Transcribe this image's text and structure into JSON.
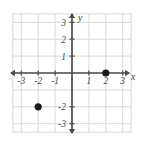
{
  "chart_data": {
    "type": "scatter",
    "title": "",
    "xlabel": "x",
    "ylabel": "y",
    "xlim": [
      -3.6,
      3.6
    ],
    "ylim": [
      -3.6,
      3.6
    ],
    "grid": true,
    "grid_step": 1,
    "legend": "none",
    "x_ticks": [
      -3,
      -2,
      -1,
      1,
      2,
      3
    ],
    "y_ticks": [
      -3,
      -2,
      1,
      2,
      3
    ],
    "x_tick_labels": [
      "-3",
      "-2",
      "-1",
      "1",
      "2",
      "3"
    ],
    "y_tick_labels": [
      "-3",
      "-2",
      "1",
      "2",
      "3"
    ],
    "points": [
      {
        "label": "point-a",
        "x": 2,
        "y": 0
      },
      {
        "label": "point-b",
        "x": -2,
        "y": -2
      }
    ],
    "colors": {
      "grid": "#d8d8d8",
      "axis": "#4d4d4d",
      "point": "#1a1a1a",
      "background": "#ffffff",
      "tick_text": "#4a4a4a"
    }
  }
}
